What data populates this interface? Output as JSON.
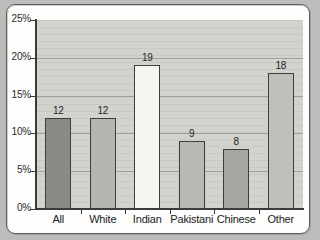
{
  "chart_data": {
    "type": "bar",
    "title": "",
    "subtitle": "",
    "xlabel": "",
    "ylabel": "",
    "categories": [
      "All",
      "White",
      "Indian",
      "Pakistani",
      "Chinese",
      "Other"
    ],
    "values": [
      12,
      12,
      19,
      9,
      8,
      18
    ],
    "value_labels": [
      "12",
      "12",
      "19",
      "9",
      "8",
      "18"
    ],
    "unit": "%",
    "ylim": [
      0,
      25
    ],
    "ytick_labels": [
      "25%",
      "20%",
      "15%",
      "10%",
      "5%",
      "0%"
    ],
    "ytick_values": [
      25,
      20,
      15,
      10,
      5,
      0
    ],
    "grid": true,
    "legend": "none",
    "bar_colors": [
      "#8a8a87",
      "#b4b4b0",
      "#f6f6f1",
      "#b9b9b5",
      "#a6a6a2",
      "#c0c0bb"
    ],
    "bar_border_color": "#3d3d3d",
    "plot_background": "#d2d2cf",
    "gridline_color": "#8f8f8d",
    "axis_color": "#3a3a3a",
    "page_background": "#bcbcba",
    "frame_background": "#fdfdfb"
  }
}
